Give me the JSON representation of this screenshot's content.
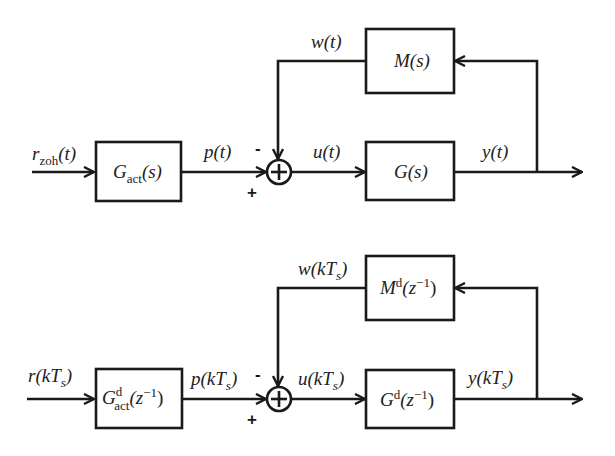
{
  "continuous": {
    "input_signal": {
      "base": "r",
      "sub": "zoh",
      "arg": "(t)"
    },
    "actuator_block": {
      "base": "G",
      "sub": "act",
      "arg": "(s)"
    },
    "actuator_output": {
      "base": "p",
      "arg": "(t)"
    },
    "feedback_block": {
      "base": "M",
      "arg": "(s)"
    },
    "feedback_signal": {
      "base": "w",
      "arg": "(t)"
    },
    "plant_input": {
      "base": "u",
      "arg": "(t)"
    },
    "plant_block": {
      "base": "G",
      "arg": "(s)"
    },
    "output_signal": {
      "base": "y",
      "arg": "(t)"
    },
    "sum_signs": {
      "minus": "-",
      "plus": "+"
    }
  },
  "discrete": {
    "input_signal": {
      "base": "r",
      "arg_open": "(k",
      "T": "T",
      "s": "s",
      "arg_close": ")"
    },
    "actuator_block": {
      "base": "G",
      "sup": "d",
      "sub": "act",
      "arg_open": "(z",
      "exp": "−1",
      "arg_close": ")"
    },
    "actuator_output": {
      "base": "p",
      "arg_open": "(k",
      "T": "T",
      "s": "s",
      "arg_close": ")"
    },
    "feedback_block": {
      "base": "M",
      "sup": "d",
      "arg_open": "(z",
      "exp": "−1",
      "arg_close": ")"
    },
    "feedback_signal": {
      "base": "w",
      "arg_open": "(k",
      "T": "T",
      "s": "s",
      "arg_close": ")"
    },
    "plant_input": {
      "base": "u",
      "arg_open": "(k",
      "T": "T",
      "s": "s",
      "arg_close": ")"
    },
    "plant_block": {
      "base": "G",
      "sup": "d",
      "arg_open": "(z",
      "exp": "−1",
      "arg_close": ")"
    },
    "output_signal": {
      "base": "y",
      "arg_open": "(k",
      "T": "T",
      "s": "s",
      "arg_close": ")"
    },
    "sum_signs": {
      "minus": "-",
      "plus": "+"
    }
  }
}
